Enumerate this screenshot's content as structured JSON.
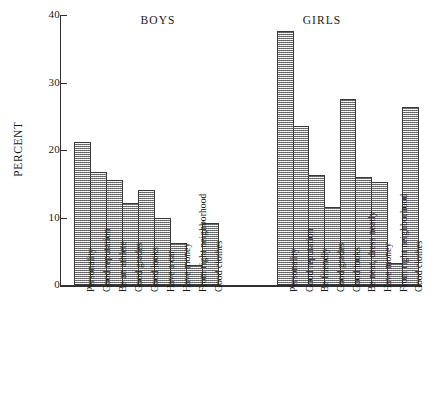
{
  "chart_data": {
    "type": "bar",
    "title": "",
    "xlabel": "",
    "ylabel": "PERCENT",
    "ylim": [
      0,
      40
    ],
    "yticks": [
      0,
      10,
      20,
      30,
      40
    ],
    "grid": false,
    "legend": "none",
    "groups": [
      {
        "name": "BOYS",
        "categories": [
          "Personality",
          "Good reputation",
          "Be an athlete",
          "Good grades",
          "Good looks",
          "Have a car",
          "Have money",
          "From right neighborhood",
          "Good clothes"
        ],
        "values": [
          21.2,
          16.7,
          15.5,
          12.1,
          14.1,
          10.0,
          6.2,
          3.0,
          9.2
        ]
      },
      {
        "name": "GIRLS",
        "categories": [
          "Personality",
          "Good reputation",
          "Be friendly",
          "Good grades",
          "Good looks",
          "Be neat, dress neatly",
          "Have money",
          "From right neighborhood",
          "Good clothes"
        ],
        "values": [
          37.7,
          23.6,
          16.3,
          11.5,
          27.5,
          16.0,
          15.3,
          3.2,
          26.4
        ]
      }
    ]
  },
  "axis": {
    "y_title": "PERCENT",
    "tick_labels": [
      "0",
      "10",
      "20",
      "30",
      "40"
    ]
  },
  "titles": {
    "boys": "BOYS",
    "girls": "GIRLS"
  },
  "colors": {
    "axis": "#303030",
    "bar_fill": "#cfcfcf",
    "bar_outline": "#3a3a3a",
    "text": "#1a1a1a",
    "background": "#ffffff"
  }
}
